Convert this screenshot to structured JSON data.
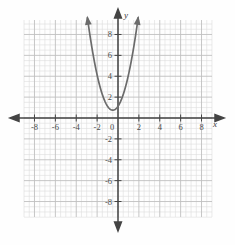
{
  "chart_data": {
    "type": "line",
    "title": "",
    "xlabel": "x",
    "ylabel": "y",
    "xlim": [
      -9,
      9
    ],
    "ylim": [
      -9.5,
      9.5
    ],
    "grid": true,
    "grid_minor_step": 0.5,
    "grid_major_step": 2,
    "legend": "none",
    "xticks": [
      -8,
      -6,
      -4,
      -2,
      0,
      2,
      4,
      6,
      8
    ],
    "xtick_labels": [
      "-8",
      "-6",
      "-4",
      "-2",
      "0",
      "2",
      "4",
      "6",
      "8"
    ],
    "yticks": [
      -8,
      -6,
      -4,
      -2,
      2,
      4,
      6,
      8
    ],
    "ytick_labels": [
      "-8",
      "-6",
      "-4",
      "-2",
      "2",
      "4",
      "6",
      "8"
    ],
    "origin_label": "0",
    "series": [
      {
        "name": "parabola",
        "kind": "parabola",
        "equation": "y = 1.5(x + 0.5)^2 + 0.75",
        "vertex": [
          -0.5,
          0.75
        ],
        "a": 1.5,
        "arrow_start": true,
        "arrow_end": true,
        "color": "#6b6b6b",
        "x": [
          -2.9,
          -2.6,
          -2.3,
          -2.0,
          -1.7,
          -1.4,
          -1.1,
          -0.8,
          -0.5,
          -0.2,
          0.1,
          0.4,
          0.7,
          1.0,
          1.3,
          1.6,
          1.9
        ],
        "y": [
          9.4,
          7.8,
          6.2,
          4.9,
          3.7,
          2.7,
          1.9,
          1.1,
          0.75,
          0.9,
          1.3,
          2.0,
          2.9,
          4.1,
          5.6,
          7.2,
          9.2
        ]
      }
    ]
  },
  "axes": {
    "x_arrow_left": true,
    "x_arrow_right": true,
    "y_arrow_up": true,
    "y_arrow_down": true,
    "x_label": "x",
    "y_label": "y"
  },
  "colors": {
    "background": "#fefefe",
    "grid_minor": "#dedede",
    "grid_major": "#bdbdbd",
    "axis": "#444444",
    "curve": "#6b6b6b",
    "tick_text": "#4a4a4a"
  }
}
